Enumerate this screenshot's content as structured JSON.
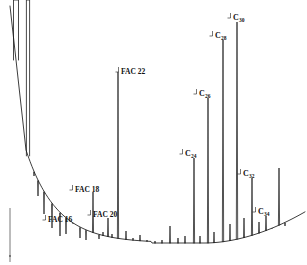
{
  "figure": {
    "width": 307,
    "height": 265,
    "background": "#ffffff",
    "ink_color": "#1a1a1a",
    "axis_color": "#555555"
  },
  "chart_data": {
    "type": "line",
    "title": "",
    "subtitle": "",
    "xlabel": "",
    "ylabel": "",
    "xlim": [
      0,
      307
    ],
    "ylim": [
      0,
      265
    ],
    "grid": false,
    "legend": null,
    "axes": {
      "y_axis_line": {
        "x": 10,
        "y_top": 208,
        "y_bottom": 262
      },
      "baseline": "exponential decay from y=150 at x=28 to y=243 near x=150, flat to x=230, rising to y=214 at x=303"
    },
    "annotations": [
      {
        "text": "FAC 16",
        "sub": "",
        "x": 48,
        "y": 216,
        "anchor": "left",
        "peak_x": 73,
        "style": "fac"
      },
      {
        "text": "FAC 18",
        "sub": "",
        "x": 75,
        "y": 186,
        "anchor": "left",
        "peak_x": 93,
        "style": "fac"
      },
      {
        "text": "FAC 20",
        "sub": "",
        "x": 93,
        "y": 211,
        "anchor": "left",
        "peak_x": 108,
        "style": "fac"
      },
      {
        "text": "FAC 22",
        "sub": "",
        "x": 121,
        "y": 68,
        "anchor": "left",
        "peak_x": 118,
        "style": "fac"
      },
      {
        "text": "C",
        "sub": "24",
        "x": 185,
        "y": 150,
        "anchor": "left",
        "peak_x": 194,
        "style": "cnum"
      },
      {
        "text": "C",
        "sub": "26",
        "x": 199,
        "y": 90,
        "anchor": "left",
        "peak_x": 208,
        "style": "cnum"
      },
      {
        "text": "C",
        "sub": "28",
        "x": 215,
        "y": 32,
        "anchor": "left",
        "peak_x": 223,
        "style": "cnum"
      },
      {
        "text": "C",
        "sub": "30",
        "x": 233,
        "y": 14,
        "anchor": "left",
        "peak_x": 237,
        "style": "cnum"
      },
      {
        "text": "C",
        "sub": "32",
        "x": 243,
        "y": 170,
        "anchor": "left",
        "peak_x": 252,
        "style": "cnum"
      },
      {
        "text": "C",
        "sub": "34",
        "x": 258,
        "y": 208,
        "anchor": "left",
        "peak_x": 266,
        "style": "cnum"
      }
    ],
    "peaks": [
      {
        "x": 16,
        "top": 2,
        "width": 5.0,
        "clipped": true,
        "name": "solvent-peak-1"
      },
      {
        "x": 28,
        "top": 2,
        "width": 3.2,
        "clipped": true,
        "name": "solvent-peak-2"
      },
      {
        "x": 34,
        "top": 176,
        "width": 0.9,
        "clipped": false,
        "name": "peak"
      },
      {
        "x": 38,
        "top": 196,
        "width": 0.9,
        "clipped": false,
        "name": "peak"
      },
      {
        "x": 44,
        "top": 214,
        "width": 0.9,
        "clipped": false,
        "name": "peak"
      },
      {
        "x": 52,
        "top": 228,
        "width": 0.9,
        "clipped": false,
        "name": "peak"
      },
      {
        "x": 60,
        "top": 236,
        "width": 0.9,
        "clipped": false,
        "name": "peak"
      },
      {
        "x": 66,
        "top": 234,
        "width": 0.9,
        "clipped": false,
        "name": "peak"
      },
      {
        "x": 73,
        "top": 224,
        "width": 1.0,
        "clipped": false,
        "name": "peak-fac16"
      },
      {
        "x": 80,
        "top": 238,
        "width": 0.9,
        "clipped": false,
        "name": "peak"
      },
      {
        "x": 86,
        "top": 240,
        "width": 0.9,
        "clipped": false,
        "name": "peak"
      },
      {
        "x": 93,
        "top": 192,
        "width": 1.1,
        "clipped": false,
        "name": "peak-fac18"
      },
      {
        "x": 99,
        "top": 239,
        "width": 0.9,
        "clipped": false,
        "name": "peak"
      },
      {
        "x": 103,
        "top": 232,
        "width": 0.9,
        "clipped": false,
        "name": "peak"
      },
      {
        "x": 108,
        "top": 218,
        "width": 1.1,
        "clipped": false,
        "name": "peak-fac20"
      },
      {
        "x": 112,
        "top": 234,
        "width": 0.9,
        "clipped": false,
        "name": "peak"
      },
      {
        "x": 118,
        "top": 72,
        "width": 1.2,
        "clipped": false,
        "name": "peak-fac22"
      },
      {
        "x": 126,
        "top": 231,
        "width": 0.9,
        "clipped": false,
        "name": "peak"
      },
      {
        "x": 133,
        "top": 238,
        "width": 0.9,
        "clipped": false,
        "name": "peak"
      },
      {
        "x": 140,
        "top": 235,
        "width": 0.9,
        "clipped": false,
        "name": "peak"
      },
      {
        "x": 147,
        "top": 240,
        "width": 0.9,
        "clipped": false,
        "name": "peak"
      },
      {
        "x": 155,
        "top": 241,
        "width": 0.9,
        "clipped": false,
        "name": "peak"
      },
      {
        "x": 162,
        "top": 240,
        "width": 0.9,
        "clipped": false,
        "name": "peak"
      },
      {
        "x": 170,
        "top": 226,
        "width": 1.0,
        "clipped": false,
        "name": "peak"
      },
      {
        "x": 178,
        "top": 238,
        "width": 0.9,
        "clipped": false,
        "name": "peak"
      },
      {
        "x": 185,
        "top": 236,
        "width": 0.9,
        "clipped": false,
        "name": "peak"
      },
      {
        "x": 194,
        "top": 158,
        "width": 1.2,
        "clipped": false,
        "name": "peak-c24"
      },
      {
        "x": 200,
        "top": 236,
        "width": 0.9,
        "clipped": false,
        "name": "peak"
      },
      {
        "x": 208,
        "top": 98,
        "width": 1.2,
        "clipped": false,
        "name": "peak-c26"
      },
      {
        "x": 214,
        "top": 232,
        "width": 0.9,
        "clipped": false,
        "name": "peak"
      },
      {
        "x": 223,
        "top": 40,
        "width": 1.3,
        "clipped": false,
        "name": "peak-c28"
      },
      {
        "x": 230,
        "top": 224,
        "width": 0.9,
        "clipped": false,
        "name": "peak"
      },
      {
        "x": 237,
        "top": 22,
        "width": 1.4,
        "clipped": false,
        "name": "peak-c30"
      },
      {
        "x": 244,
        "top": 218,
        "width": 1.0,
        "clipped": false,
        "name": "peak"
      },
      {
        "x": 252,
        "top": 178,
        "width": 1.2,
        "clipped": false,
        "name": "peak-c32"
      },
      {
        "x": 259,
        "top": 222,
        "width": 1.0,
        "clipped": false,
        "name": "peak"
      },
      {
        "x": 266,
        "top": 216,
        "width": 1.1,
        "clipped": false,
        "name": "peak-c34"
      },
      {
        "x": 272,
        "top": 228,
        "width": 0.9,
        "clipped": false,
        "name": "peak"
      },
      {
        "x": 279,
        "top": 168,
        "width": 1.2,
        "clipped": false,
        "name": "peak"
      },
      {
        "x": 285,
        "top": 226,
        "width": 0.9,
        "clipped": false,
        "name": "peak"
      }
    ]
  }
}
